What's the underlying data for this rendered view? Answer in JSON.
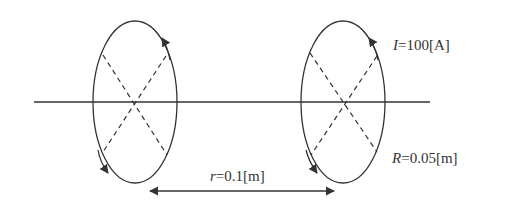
{
  "diagram": {
    "type": "two coaxial current loops",
    "colors": {
      "stroke": "#333333",
      "background": "#ffffff"
    },
    "axis": {
      "x1": 34,
      "x2": 430,
      "y": 102
    },
    "loops": [
      {
        "name": "left-loop",
        "cx": 135,
        "cy": 102,
        "rx": 42,
        "ry": 81
      },
      {
        "name": "right-loop",
        "cx": 343,
        "cy": 102,
        "rx": 42,
        "ry": 81
      }
    ],
    "dimension": {
      "x1": 148,
      "x2": 336,
      "y": 191
    }
  },
  "labels": {
    "current": {
      "symbol": "I",
      "value": "=100[A]"
    },
    "radius": {
      "symbol": "R",
      "value": "=0.05[m]"
    },
    "distance": {
      "symbol": "r",
      "value": "=0.1[m]"
    }
  }
}
